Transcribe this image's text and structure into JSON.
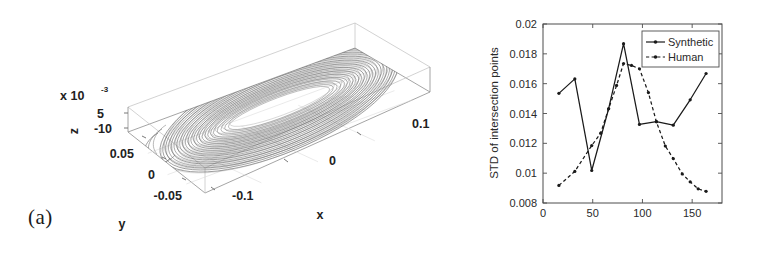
{
  "figure": {
    "panels": [
      {
        "id": "a",
        "label": "(a)"
      },
      {
        "id": "b",
        "label": "(b)"
      }
    ]
  },
  "panel_a": {
    "label": "(a)",
    "type": "3d-phase-portrait",
    "axes": {
      "x": {
        "title": "x",
        "ticks": [
          "-0.1",
          "0",
          "0.1"
        ]
      },
      "y": {
        "title": "y",
        "ticks": [
          "0.05",
          "0",
          "-0.05"
        ]
      },
      "z": {
        "title": "z",
        "ticks": [
          "5",
          "-10"
        ],
        "exponent_base": "x 10",
        "exponent_power": "-3"
      }
    }
  },
  "panel_b": {
    "label": "(b)"
  },
  "chart_data": {
    "type": "line",
    "title": "",
    "xlabel": "",
    "ylabel": "STD of intersection points",
    "xlim": [
      0,
      180
    ],
    "ylim": [
      0.008,
      0.02
    ],
    "xticks": [
      0,
      50,
      100,
      150
    ],
    "xticklabels": [
      "0",
      "50",
      "100",
      "150"
    ],
    "yticks": [
      0.008,
      0.01,
      0.012,
      0.014,
      0.016,
      0.018,
      0.02
    ],
    "yticklabels": [
      "0.008",
      "0.01",
      "0.012",
      "0.014",
      "0.016",
      "0.018",
      "0.02"
    ],
    "grid": false,
    "legend_position": "upper right",
    "series": [
      {
        "name": "Synthetic",
        "style": "solid",
        "marker": "dot",
        "color": "#1a1a1a",
        "x": [
          16,
          32,
          49,
          66,
          81,
          97,
          114,
          131,
          148,
          164
        ],
        "y": [
          0.01535,
          0.01632,
          0.01018,
          0.01432,
          0.01868,
          0.01327,
          0.01345,
          0.01322,
          0.01492,
          0.01668
        ]
      },
      {
        "name": "Human",
        "style": "dashed",
        "marker": "dot",
        "color": "#1a1a1a",
        "x": [
          16,
          32,
          49,
          58,
          66,
          74,
          81,
          89,
          97,
          106,
          114,
          123,
          131,
          140,
          148,
          156,
          164
        ],
        "y": [
          0.00918,
          0.01012,
          0.01185,
          0.01268,
          0.01432,
          0.01588,
          0.01735,
          0.01722,
          0.017,
          0.0154,
          0.01345,
          0.01182,
          0.01098,
          0.00995,
          0.00942,
          0.00895,
          0.00878
        ]
      }
    ]
  }
}
